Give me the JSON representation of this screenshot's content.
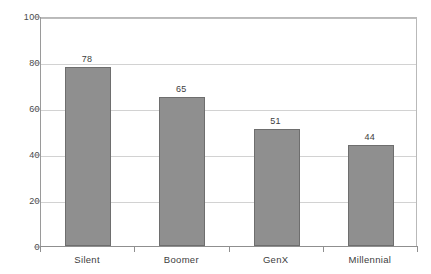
{
  "chart_data": {
    "type": "bar",
    "title": "",
    "subtitle": "",
    "xlabel": "",
    "ylabel": "",
    "categories": [
      "Silent",
      "Boomer",
      "GenX",
      "Millennial"
    ],
    "values": [
      78,
      65,
      51,
      44
    ],
    "value_labels": [
      "78",
      "65",
      "51",
      "44"
    ],
    "ylim": [
      0,
      100
    ],
    "yticks": [
      0,
      20,
      40,
      60,
      80,
      100
    ],
    "ytick_labels": [
      "0",
      "20",
      "40",
      "60",
      "80",
      "100"
    ],
    "grid": true,
    "grid_axis": "y",
    "legend": false,
    "legend_position": "none",
    "bar_color": "#8f8f8f",
    "bar_edge_color": "#6e6e6e",
    "gridline_color": "#d2d2d2",
    "axis_color": "#8f8f8f",
    "background_color": "#ffffff",
    "text_color": "#3d3d3d"
  }
}
